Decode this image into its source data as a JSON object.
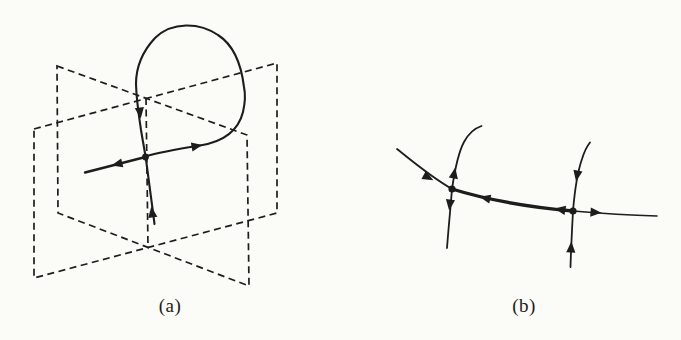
{
  "captions": {
    "a": "(a)",
    "b": "(b)"
  },
  "colors": {
    "background": "#fbfbf8",
    "ink": "#1d1d1d"
  }
}
